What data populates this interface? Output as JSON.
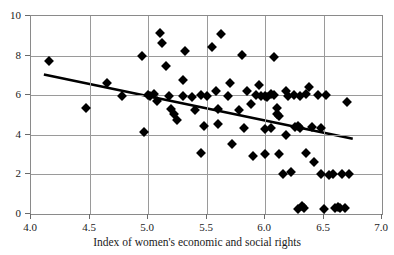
{
  "figure": {
    "xlabel": "Index of women's economic and social rights",
    "ylabel_partial": "",
    "background_color": "#ffffff",
    "marker_color": "#000000",
    "grid_color": "#9a9a9a",
    "trendline_color": "#000000"
  },
  "chart_data": {
    "type": "scatter",
    "title": "",
    "xlabel": "Index of women's economic and social rights",
    "ylabel": "",
    "xlim": [
      4.0,
      7.0
    ],
    "ylim": [
      0,
      10
    ],
    "xticks": [
      "4.0",
      "4.5",
      "5.0",
      "5.5",
      "6.0",
      "6.5",
      "7.0"
    ],
    "xtick_values": [
      4.0,
      4.5,
      5.0,
      5.5,
      6.0,
      6.5,
      7.0
    ],
    "yticks": [
      "0",
      "2",
      "4",
      "6",
      "8",
      "10"
    ],
    "ytick_values": [
      0,
      2,
      4,
      6,
      8,
      10
    ],
    "grid": true,
    "legend": "none",
    "series": [
      {
        "name": "observations",
        "marker": "diamond",
        "points": [
          [
            4.15,
            7.75
          ],
          [
            4.47,
            5.35
          ],
          [
            4.65,
            6.6
          ],
          [
            4.78,
            5.95
          ],
          [
            4.95,
            8.0
          ],
          [
            4.97,
            4.15
          ],
          [
            5.0,
            6.0
          ],
          [
            5.05,
            6.05
          ],
          [
            5.08,
            5.7
          ],
          [
            5.1,
            9.15
          ],
          [
            5.12,
            8.65
          ],
          [
            5.15,
            7.45
          ],
          [
            5.18,
            5.95
          ],
          [
            5.2,
            5.3
          ],
          [
            5.22,
            5.05
          ],
          [
            5.25,
            4.75
          ],
          [
            5.3,
            6.75
          ],
          [
            5.32,
            8.25
          ],
          [
            5.38,
            5.9
          ],
          [
            5.4,
            5.25
          ],
          [
            5.45,
            6.0
          ],
          [
            5.48,
            4.45
          ],
          [
            5.5,
            5.95
          ],
          [
            5.55,
            8.45
          ],
          [
            5.58,
            6.2
          ],
          [
            5.6,
            5.3
          ],
          [
            5.62,
            9.1
          ],
          [
            5.68,
            5.95
          ],
          [
            5.7,
            6.6
          ],
          [
            5.72,
            3.55
          ],
          [
            5.78,
            5.25
          ],
          [
            5.8,
            8.05
          ],
          [
            5.85,
            6.2
          ],
          [
            5.88,
            5.55
          ],
          [
            5.92,
            6.0
          ],
          [
            5.95,
            6.5
          ],
          [
            5.97,
            5.95
          ],
          [
            6.0,
            5.95
          ],
          [
            6.02,
            5.9
          ],
          [
            6.05,
            4.35
          ],
          [
            6.08,
            7.95
          ],
          [
            6.1,
            5.35
          ],
          [
            6.12,
            3.05
          ],
          [
            6.15,
            2.0
          ],
          [
            6.18,
            4.0
          ],
          [
            6.2,
            5.95
          ],
          [
            6.22,
            2.1
          ],
          [
            6.25,
            6.0
          ],
          [
            6.28,
            0.25
          ],
          [
            6.3,
            5.95
          ],
          [
            6.32,
            0.4
          ],
          [
            6.33,
            0.3
          ],
          [
            6.35,
            3.1
          ],
          [
            6.38,
            6.4
          ],
          [
            6.4,
            4.4
          ],
          [
            6.42,
            2.65
          ],
          [
            6.45,
            6.0
          ],
          [
            6.48,
            2.0
          ],
          [
            6.5,
            0.25
          ],
          [
            6.52,
            6.0
          ],
          [
            6.55,
            1.95
          ],
          [
            6.58,
            2.0
          ],
          [
            6.6,
            0.3
          ],
          [
            6.62,
            0.35
          ],
          [
            6.64,
            0.3
          ],
          [
            6.66,
            2.0
          ],
          [
            6.68,
            0.3
          ],
          [
            6.7,
            5.65
          ],
          [
            6.72,
            2.0
          ],
          [
            6.18,
            6.2
          ],
          [
            6.35,
            6.05
          ],
          [
            6.05,
            6.05
          ],
          [
            6.08,
            6.0
          ],
          [
            5.9,
            2.95
          ],
          [
            6.0,
            3.05
          ],
          [
            5.82,
            4.35
          ],
          [
            6.0,
            4.3
          ],
          [
            6.48,
            4.35
          ],
          [
            5.6,
            4.55
          ],
          [
            5.45,
            3.1
          ],
          [
            5.02,
            5.95
          ],
          [
            6.28,
            4.45
          ],
          [
            6.26,
            4.4
          ],
          [
            6.3,
            4.35
          ],
          [
            5.3,
            5.95
          ],
          [
            6.12,
            4.95
          ],
          [
            6.1,
            5.05
          ]
        ]
      }
    ],
    "trendline": {
      "type": "linear",
      "x_start": 4.11,
      "y_start": 7.05,
      "x_end": 6.75,
      "y_end": 3.8
    }
  }
}
